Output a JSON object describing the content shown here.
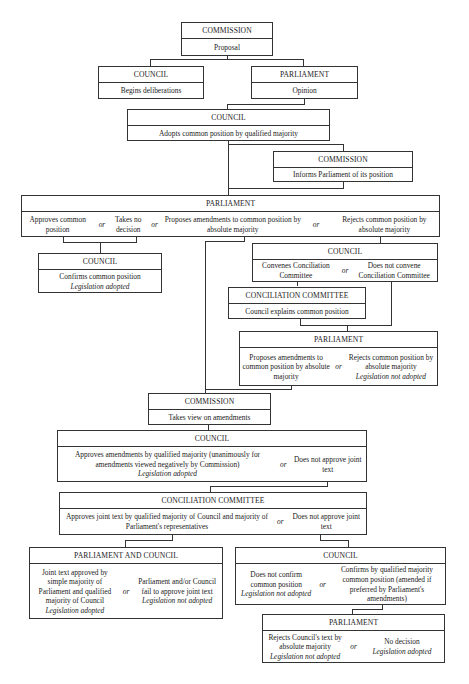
{
  "diagram": {
    "or_label": "or",
    "nodes": {
      "commission_proposal": {
        "title": "COMMISSION",
        "body": "Proposal"
      },
      "council_begins": {
        "title": "COUNCIL",
        "body": "Begins deliberations"
      },
      "parliament_opinion": {
        "title": "PARLIAMENT",
        "body": "Opinion"
      },
      "council_adopts": {
        "title": "COUNCIL",
        "body": "Adopts common position by qualified majority"
      },
      "commission_informs": {
        "title": "COMMISSION",
        "body": "Informs Parliament of its position"
      },
      "parliament_second": {
        "title": "PARLIAMENT",
        "options": [
          "Approves common position",
          "Takes no decision",
          "Proposes amendments to common position by absolute majority",
          "Rejects common position by absolute majority"
        ]
      },
      "council_confirms": {
        "title": "COUNCIL",
        "body": "Confirms common position",
        "result": "Legislation adopted"
      },
      "council_convenes": {
        "title": "COUNCIL",
        "options": [
          "Convenes Conciliation Committee",
          "Does not convene Conciliation Committee"
        ]
      },
      "conciliation_explains": {
        "title": "CONCILIATION COMMITTEE",
        "body": "Council explains common position"
      },
      "parliament_third": {
        "title": "PARLIAMENT",
        "options": [
          "Proposes amendments to common position by absolute majority",
          "Rejects common position by absolute majority"
        ],
        "results": [
          "",
          "Legislation not adopted"
        ]
      },
      "commission_view": {
        "title": "COMMISSION",
        "body": "Takes view on amendments"
      },
      "council_amendments": {
        "title": "COUNCIL",
        "options": [
          "Approves amendments by qualified majority (unanimously for amendments viewed negatively by Commission)",
          "Does not approve joint text"
        ],
        "results": [
          "Legislation adopted",
          ""
        ]
      },
      "conciliation_joint": {
        "title": "CONCILIATION COMMITTEE",
        "options": [
          "Approves joint text by qualified majority of Council and majority of Parliament's representatives",
          "Does not approve joint text"
        ]
      },
      "parliament_and_council": {
        "title": "PARLIAMENT AND COUNCIL",
        "options": [
          "Joint text approved by simple majority of Parliament and qualified majority of Council",
          "Parliament and/or Council fail to approve joint text"
        ],
        "results": [
          "Legislation adopted",
          "Legislation not adopted"
        ]
      },
      "council_final": {
        "title": "COUNCIL",
        "options": [
          "Does not confirm common position",
          "Confirms by qualified majority common position (amended if preferred by Parliament's amendments)"
        ],
        "results": [
          "Legislation not adopted",
          ""
        ]
      },
      "parliament_final": {
        "title": "PARLIAMENT",
        "options": [
          "Rejects Council's text by absolute majority",
          "No decision"
        ],
        "results": [
          "Legislation not adopted",
          "Legislation adopted"
        ]
      }
    }
  }
}
